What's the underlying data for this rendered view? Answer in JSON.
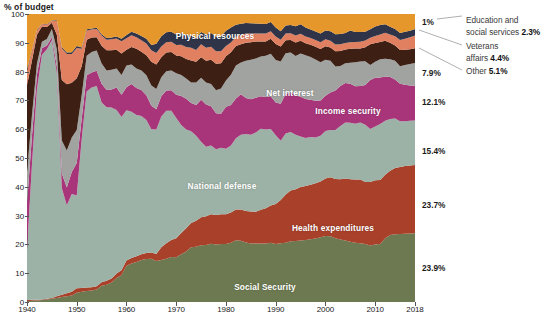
{
  "axis_title": "% of budget",
  "chart_data": {
    "type": "area",
    "stacked": true,
    "stack_mode": "percent",
    "title": "% of budget",
    "xlabel": "",
    "ylabel": "% of budget",
    "xlim": [
      1940,
      2018
    ],
    "ylim": [
      0,
      100
    ],
    "grid": false,
    "legend_position": "in-plot labels and right-edge value labels",
    "x_ticks": [
      "1940",
      "1950",
      "1960",
      "1970",
      "1980",
      "1990",
      "2000",
      "2010",
      "2018"
    ],
    "x_tick_values": [
      1940,
      1950,
      1960,
      1970,
      1980,
      1990,
      2000,
      2010,
      2018
    ],
    "y_ticks": [
      "0",
      "10",
      "20",
      "30",
      "40",
      "50",
      "60",
      "70",
      "80",
      "90",
      "100"
    ],
    "y_tick_values": [
      0,
      10,
      20,
      30,
      40,
      50,
      60,
      70,
      80,
      90,
      100
    ],
    "x": [
      1940,
      1941,
      1942,
      1943,
      1944,
      1945,
      1946,
      1947,
      1948,
      1949,
      1950,
      1951,
      1952,
      1953,
      1954,
      1955,
      1956,
      1957,
      1958,
      1959,
      1960,
      1961,
      1962,
      1963,
      1964,
      1965,
      1966,
      1967,
      1968,
      1969,
      1970,
      1971,
      1972,
      1973,
      1974,
      1975,
      1976,
      1977,
      1978,
      1979,
      1980,
      1981,
      1982,
      1983,
      1984,
      1985,
      1986,
      1987,
      1988,
      1989,
      1990,
      1991,
      1992,
      1993,
      1994,
      1995,
      1996,
      1997,
      1998,
      1999,
      2000,
      2001,
      2002,
      2003,
      2004,
      2005,
      2006,
      2007,
      2008,
      2009,
      2010,
      2011,
      2012,
      2013,
      2014,
      2015,
      2016,
      2017,
      2018
    ],
    "series": [
      {
        "name": "Social Security",
        "color": "#6d7a51",
        "final_share": "23.9%",
        "label_in_chart": "Social Security",
        "values": [
          0.3,
          0.4,
          0.5,
          0.7,
          0.9,
          1.1,
          1.4,
          1.7,
          2.0,
          2.3,
          3.2,
          3.6,
          3.8,
          4.0,
          4.3,
          5.6,
          6.0,
          6.8,
          8.3,
          9.3,
          12.6,
          13.4,
          13.9,
          14.6,
          14.9,
          15.0,
          14.2,
          14.6,
          15.0,
          15.6,
          15.5,
          16.6,
          17.5,
          18.6,
          19.2,
          19.5,
          19.8,
          20.2,
          20.0,
          20.1,
          20.1,
          20.6,
          21.4,
          21.3,
          20.7,
          20.3,
          20.4,
          20.3,
          20.3,
          20.6,
          20.1,
          20.4,
          21.0,
          21.5,
          21.6,
          21.8,
          22.0,
          22.2,
          22.5,
          22.9,
          22.9,
          22.8,
          22.6,
          22.1,
          21.8,
          21.3,
          21.0,
          20.8,
          20.9,
          20.0,
          20.4,
          20.3,
          22.1,
          23.3,
          23.5,
          23.6,
          23.7,
          23.8,
          23.9
        ]
      },
      {
        "name": "Health expenditures",
        "color": "#a8402a",
        "final_share": "23.7%",
        "label_in_chart": "Health expenditures",
        "values": [
          0.4,
          0.4,
          0.3,
          0.2,
          0.2,
          0.3,
          0.6,
          0.8,
          1.0,
          1.3,
          1.6,
          1.3,
          1.2,
          1.1,
          1.2,
          1.3,
          1.4,
          1.4,
          1.6,
          1.7,
          1.8,
          1.9,
          2.0,
          2.0,
          2.1,
          2.2,
          2.5,
          4.4,
          5.4,
          5.9,
          6.6,
          7.4,
          8.1,
          8.3,
          9.0,
          9.6,
          10.0,
          10.3,
          10.2,
          10.4,
          10.4,
          10.5,
          10.7,
          10.8,
          10.9,
          11.1,
          11.1,
          11.7,
          12.2,
          12.9,
          13.9,
          15.0,
          17.1,
          18.0,
          18.3,
          18.9,
          19.1,
          19.3,
          19.6,
          19.8,
          20.0,
          20.5,
          21.0,
          21.4,
          21.9,
          22.2,
          22.4,
          22.6,
          22.4,
          22.5,
          22.7,
          22.5,
          22.1,
          22.3,
          23.0,
          23.3,
          23.5,
          23.6,
          23.7
        ]
      },
      {
        "name": "National defense",
        "color": "#9db2a6",
        "final_share": "15.4%",
        "label_in_chart": "National defense",
        "values": [
          17.5,
          47.1,
          73.0,
          84.9,
          86.7,
          89.5,
          77.3,
          37.1,
          30.6,
          33.9,
          32.2,
          51.8,
          68.1,
          69.4,
          69.5,
          62.4,
          60.2,
          59.3,
          56.8,
          53.2,
          52.2,
          50.8,
          49.0,
          48.0,
          46.2,
          42.8,
          43.2,
          45.4,
          46.0,
          44.9,
          41.8,
          37.5,
          34.3,
          31.2,
          29.5,
          26.0,
          24.1,
          23.8,
          22.8,
          23.1,
          22.7,
          23.2,
          24.8,
          26.0,
          26.7,
          26.7,
          27.6,
          28.1,
          27.3,
          26.6,
          23.9,
          20.6,
          21.6,
          20.7,
          19.3,
          17.9,
          17.0,
          16.9,
          16.2,
          16.2,
          16.5,
          16.4,
          17.3,
          18.8,
          19.9,
          20.0,
          19.7,
          20.2,
          20.7,
          18.8,
          19.1,
          19.6,
          18.7,
          17.9,
          17.2,
          15.9,
          15.6,
          15.5,
          15.4
        ]
      },
      {
        "name": "Income security",
        "color": "#a8357a",
        "final_share": "12.1%",
        "label_in_chart": "Income security",
        "values": [
          16.0,
          10.0,
          5.2,
          2.3,
          1.3,
          1.0,
          2.5,
          5.0,
          6.2,
          7.6,
          11.3,
          7.0,
          5.6,
          5.2,
          5.3,
          6.5,
          6.0,
          6.3,
          7.8,
          7.8,
          8.0,
          9.6,
          9.4,
          9.0,
          8.6,
          8.1,
          7.0,
          7.0,
          7.0,
          7.1,
          8.1,
          10.0,
          10.7,
          9.6,
          10.7,
          14.4,
          14.7,
          13.7,
          12.5,
          11.8,
          14.6,
          14.1,
          13.8,
          14.0,
          12.5,
          12.3,
          12.1,
          11.3,
          11.2,
          11.3,
          11.4,
          12.8,
          14.0,
          14.1,
          14.0,
          14.1,
          13.8,
          13.2,
          13.0,
          12.5,
          12.2,
          13.0,
          14.0,
          14.2,
          14.0,
          13.8,
          13.3,
          12.9,
          14.4,
          17.3,
          17.2,
          16.3,
          15.4,
          14.6,
          13.6,
          13.0,
          12.6,
          12.3,
          12.1
        ]
      },
      {
        "name": "Net interest",
        "color": "#a0a3a0",
        "final_share": "7.9%",
        "label_in_chart": "Net interest",
        "values": [
          11.0,
          7.3,
          3.8,
          2.3,
          2.2,
          2.9,
          6.0,
          11.5,
          12.8,
          12.0,
          11.4,
          8.2,
          6.8,
          7.1,
          7.0,
          7.0,
          6.8,
          6.8,
          6.6,
          6.8,
          7.5,
          6.8,
          6.8,
          6.8,
          6.9,
          7.1,
          7.1,
          6.6,
          6.7,
          6.9,
          7.4,
          7.3,
          7.0,
          7.0,
          7.8,
          7.6,
          7.6,
          7.7,
          8.0,
          8.7,
          9.1,
          10.5,
          11.4,
          11.1,
          13.0,
          13.7,
          13.7,
          13.8,
          14.3,
          14.8,
          14.7,
          14.7,
          14.4,
          14.1,
          13.9,
          15.3,
          15.5,
          15.2,
          14.6,
          13.5,
          12.5,
          11.1,
          8.5,
          7.1,
          7.0,
          7.4,
          8.5,
          8.7,
          8.5,
          5.3,
          5.7,
          6.4,
          6.2,
          6.2,
          6.5,
          6.1,
          6.9,
          7.4,
          7.9
        ]
      },
      {
        "name": "Other",
        "color": "#3d1f14",
        "final_share": "5.1%",
        "label_callout": "Other",
        "values": [
          30.0,
          19.0,
          10.0,
          5.3,
          4.2,
          2.2,
          5.0,
          21.0,
          23.0,
          19.0,
          18.0,
          10.0,
          5.6,
          5.0,
          4.6,
          6.2,
          7.0,
          6.8,
          6.5,
          7.5,
          5.5,
          6.0,
          6.8,
          6.5,
          7.0,
          8.2,
          8.5,
          7.0,
          6.5,
          6.4,
          6.2,
          6.5,
          6.8,
          7.5,
          7.2,
          7.0,
          7.6,
          8.4,
          9.2,
          8.8,
          8.4,
          7.8,
          6.8,
          6.3,
          6.2,
          6.1,
          5.9,
          5.2,
          5.0,
          5.2,
          5.6,
          5.2,
          4.6,
          4.4,
          4.8,
          4.5,
          4.2,
          4.3,
          4.5,
          4.7,
          4.7,
          4.6,
          5.4,
          5.3,
          4.8,
          5.0,
          4.9,
          4.6,
          5.1,
          7.4,
          6.6,
          6.1,
          6.2,
          5.7,
          5.3,
          5.6,
          5.3,
          5.2,
          5.1
        ]
      },
      {
        "name": "Veterans affairs",
        "color": "#e08060",
        "final_share": "4.4%",
        "label_callout": "Veterans affairs",
        "values": [
          5.0,
          3.2,
          1.5,
          0.8,
          0.8,
          0.6,
          4.8,
          11.0,
          10.5,
          10.0,
          10.5,
          6.0,
          3.2,
          2.8,
          2.9,
          3.5,
          3.7,
          3.8,
          3.9,
          4.2,
          4.0,
          4.1,
          4.0,
          4.0,
          4.1,
          4.0,
          4.0,
          3.7,
          3.6,
          3.6,
          3.6,
          4.0,
          4.1,
          4.3,
          4.1,
          4.5,
          4.5,
          4.5,
          4.4,
          4.2,
          3.6,
          3.4,
          3.2,
          3.2,
          3.2,
          3.0,
          2.8,
          2.7,
          2.7,
          2.6,
          2.6,
          2.4,
          2.4,
          2.4,
          2.5,
          2.5,
          2.4,
          2.4,
          2.4,
          2.4,
          2.4,
          2.3,
          2.4,
          2.4,
          2.3,
          2.3,
          2.3,
          2.4,
          2.4,
          2.3,
          2.5,
          2.6,
          2.8,
          2.9,
          3.2,
          3.5,
          3.8,
          4.1,
          4.4
        ]
      },
      {
        "name": "Education and social services",
        "color": "#2f3448",
        "final_share": "2.3%",
        "label_callout": "Education and social services",
        "first_value_label": "1%",
        "values": [
          0.6,
          0.4,
          0.2,
          0.1,
          0.1,
          0.1,
          0.2,
          0.4,
          0.5,
          0.6,
          0.7,
          0.5,
          0.4,
          0.4,
          0.4,
          0.5,
          0.6,
          0.6,
          0.7,
          0.9,
          1.1,
          1.2,
          1.3,
          1.5,
          1.6,
          1.8,
          3.2,
          3.6,
          3.5,
          3.4,
          3.7,
          4.0,
          4.2,
          4.2,
          4.0,
          4.2,
          4.6,
          4.8,
          5.0,
          5.2,
          5.3,
          5.2,
          4.2,
          3.9,
          3.7,
          3.6,
          3.5,
          3.4,
          3.3,
          3.2,
          3.1,
          2.9,
          2.8,
          2.9,
          3.3,
          3.4,
          3.2,
          3.0,
          3.0,
          3.1,
          3.1,
          3.3,
          3.6,
          3.6,
          3.6,
          4.2,
          3.5,
          3.4,
          3.2,
          3.0,
          3.4,
          3.3,
          2.9,
          2.7,
          2.5,
          2.4,
          2.4,
          2.3,
          2.3
        ]
      },
      {
        "name": "Physical resources",
        "color": "#e5972b",
        "final_share": "",
        "label_in_chart": "Physical resources",
        "values": [
          19.2,
          12.6,
          5.5,
          3.4,
          3.6,
          2.3,
          2.2,
          11.5,
          13.4,
          13.3,
          11.1,
          11.6,
          5.3,
          5.0,
          4.8,
          7.0,
          8.3,
          8.2,
          7.8,
          8.6,
          7.3,
          6.2,
          6.8,
          7.6,
          8.6,
          10.8,
          10.3,
          7.7,
          6.3,
          6.2,
          7.1,
          6.7,
          7.3,
          7.3,
          8.5,
          6.2,
          7.1,
          6.6,
          7.9,
          7.7,
          5.8,
          4.7,
          3.7,
          3.4,
          3.1,
          3.2,
          3.3,
          3.4,
          3.5,
          2.8,
          4.7,
          6.0,
          4.1,
          3.9,
          4.3,
          3.6,
          4.8,
          5.5,
          6.2,
          6.9,
          5.7,
          6.0,
          7.2,
          7.1,
          6.7,
          5.8,
          6.4,
          6.4,
          6.4,
          5.4,
          4.4,
          3.9,
          3.6,
          4.4,
          5.2,
          6.6,
          6.2,
          5.8,
          5.2
        ]
      }
    ]
  },
  "right_labels": [
    {
      "id": "education",
      "text": "1%",
      "y": 22
    },
    {
      "id": "other",
      "text": "7.9%",
      "y": 73
    },
    {
      "id": "interest",
      "text": "12.1%",
      "y": 102
    },
    {
      "id": "income",
      "text": "15.4%",
      "y": 151
    },
    {
      "id": "defense",
      "text": "23.7%",
      "y": 205
    },
    {
      "id": "health",
      "text": "23.9%",
      "y": 268
    }
  ],
  "callouts": [
    {
      "id": "education",
      "line1": "Education and",
      "line2": "social services",
      "value": "2.3%"
    },
    {
      "id": "veterans",
      "line1": "Veterans",
      "line2": "affairs",
      "value": "4.4%"
    },
    {
      "id": "other",
      "line1": "Other",
      "line2": "",
      "value": "5.1%"
    }
  ]
}
